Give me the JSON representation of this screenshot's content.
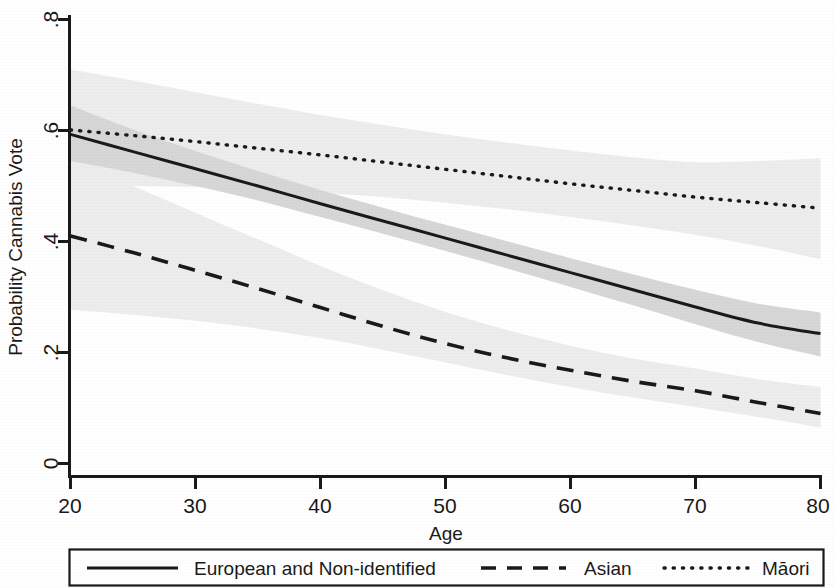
{
  "chart_data": {
    "type": "line",
    "title": "",
    "xlabel": "Age",
    "ylabel": "Probability Cannabis Vote",
    "xlim": [
      20,
      80
    ],
    "ylim": [
      0,
      0.8
    ],
    "xticks": [
      20,
      30,
      40,
      50,
      60,
      70,
      80
    ],
    "xtick_labels": [
      "20",
      "30",
      "40",
      "50",
      "60",
      "70",
      "80"
    ],
    "yticks": [
      0,
      0.2,
      0.4,
      0.6,
      0.8
    ],
    "ytick_labels": [
      "0",
      ".2",
      ".4",
      ".6",
      ".8"
    ],
    "grid": false,
    "legend_position": "bottom",
    "x": [
      20,
      25,
      30,
      35,
      40,
      45,
      50,
      55,
      60,
      65,
      70,
      75,
      80
    ],
    "series": [
      {
        "name": "European and Non-identified",
        "legend_label": "European and Non-identified",
        "style": "solid",
        "color": "#1a1a1a",
        "values": [
          0.593,
          0.562,
          0.531,
          0.5,
          0.468,
          0.437,
          0.406,
          0.375,
          0.344,
          0.313,
          0.282,
          0.253,
          0.234
        ],
        "ci_lower": [
          0.545,
          0.524,
          0.5,
          0.474,
          0.444,
          0.414,
          0.383,
          0.351,
          0.318,
          0.285,
          0.251,
          0.219,
          0.193
        ],
        "ci_upper": [
          0.645,
          0.602,
          0.563,
          0.527,
          0.493,
          0.461,
          0.43,
          0.4,
          0.37,
          0.341,
          0.313,
          0.288,
          0.272
        ]
      },
      {
        "name": "Asian",
        "legend_label": "Asian",
        "style": "dashed",
        "color": "#1a1a1a",
        "values": [
          0.41,
          0.38,
          0.348,
          0.315,
          0.281,
          0.247,
          0.216,
          0.19,
          0.168,
          0.148,
          0.131,
          0.11,
          0.09
        ],
        "ci_lower": [
          0.277,
          0.268,
          0.257,
          0.243,
          0.226,
          0.205,
          0.182,
          0.159,
          0.138,
          0.119,
          0.102,
          0.084,
          0.065
        ],
        "ci_upper": [
          0.545,
          0.5,
          0.452,
          0.404,
          0.356,
          0.312,
          0.273,
          0.24,
          0.212,
          0.189,
          0.171,
          0.152,
          0.138
        ]
      },
      {
        "name": "Māori",
        "legend_label": "Māori",
        "style": "dotted",
        "color": "#1a1a1a",
        "values": [
          0.601,
          0.591,
          0.58,
          0.568,
          0.556,
          0.543,
          0.53,
          0.517,
          0.504,
          0.492,
          0.48,
          0.47,
          0.46
        ],
        "ci_lower": [
          0.5,
          0.5,
          0.498,
          0.494,
          0.488,
          0.48,
          0.47,
          0.458,
          0.444,
          0.429,
          0.412,
          0.392,
          0.368
        ],
        "ci_upper": [
          0.71,
          0.69,
          0.669,
          0.648,
          0.628,
          0.61,
          0.593,
          0.578,
          0.564,
          0.552,
          0.543,
          0.545,
          0.55
        ]
      }
    ],
    "band_colors": {
      "solid_band": "#d8d8d8",
      "dashed_band": "#eeeeee",
      "dotted_band": "#eeeeee"
    }
  },
  "axes": {
    "y_title": "Probability Cannabis Vote",
    "x_title": "Age",
    "y_tick_0": "0",
    "y_tick_1": ".2",
    "y_tick_2": ".4",
    "y_tick_3": ".6",
    "y_tick_4": ".8",
    "x_tick_0": "20",
    "x_tick_1": "30",
    "x_tick_2": "40",
    "x_tick_3": "50",
    "x_tick_4": "60",
    "x_tick_5": "70",
    "x_tick_6": "80"
  },
  "legend": {
    "entry_european": "European and Non-identified",
    "entry_asian": "Asian",
    "entry_maori": "Māori"
  }
}
